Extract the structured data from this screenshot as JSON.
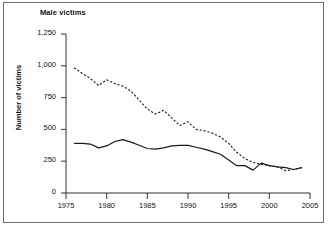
{
  "figure": {
    "title": "Male victims",
    "border": true
  },
  "chart_data": {
    "type": "line",
    "title": "Male victims",
    "xlabel": "",
    "ylabel": "Number of victims",
    "xlim": [
      1975,
      2005
    ],
    "ylim": [
      0,
      1250
    ],
    "xticks": [
      1975,
      1980,
      1985,
      1990,
      1995,
      2000,
      2005
    ],
    "xtick_labels": [
      "1975",
      "1980",
      "1985",
      "1990",
      "1995",
      "2000",
      "2005"
    ],
    "yticks": [
      0,
      250,
      500,
      750,
      1000,
      1250
    ],
    "ytick_labels": [
      "0",
      "250",
      "500",
      "750",
      "1,000",
      "1,250"
    ],
    "grid": false,
    "legend": "none",
    "x": [
      1976,
      1977,
      1978,
      1979,
      1980,
      1981,
      1982,
      1983,
      1984,
      1985,
      1986,
      1987,
      1988,
      1989,
      1990,
      1991,
      1992,
      1993,
      1994,
      1995,
      1996,
      1997,
      1998,
      1999,
      2000,
      2001,
      2002,
      2003,
      2004
    ],
    "series": [
      {
        "name": "dashed-series",
        "style": "dashed",
        "color": "#1a1a1a",
        "values": [
          985,
          940,
          900,
          845,
          890,
          860,
          840,
          800,
          730,
          660,
          620,
          650,
          590,
          530,
          560,
          500,
          490,
          470,
          440,
          390,
          320,
          270,
          240,
          225,
          215,
          205,
          175,
          185,
          200
        ]
      },
      {
        "name": "solid-series",
        "style": "solid",
        "color": "#1a1a1a",
        "values": [
          390,
          390,
          385,
          355,
          370,
          405,
          420,
          400,
          375,
          350,
          345,
          355,
          370,
          375,
          375,
          360,
          345,
          325,
          305,
          260,
          215,
          215,
          180,
          235,
          215,
          205,
          200,
          185,
          200
        ]
      }
    ]
  }
}
